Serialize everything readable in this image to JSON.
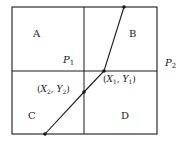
{
  "diagram": {
    "regions": [
      {
        "id": "A",
        "label": "A"
      },
      {
        "id": "B",
        "label": "B"
      },
      {
        "id": "C",
        "label": "C"
      },
      {
        "id": "D",
        "label": "D"
      }
    ],
    "planes": {
      "p1": {
        "base": "P",
        "sub": "1"
      },
      "p2": {
        "base": "P",
        "sub": "2"
      }
    },
    "points": {
      "pt1": {
        "open": "(",
        "x": "X",
        "xsub": "1",
        "sep": ", ",
        "y": "Y",
        "ysub": "1",
        "close": ")"
      },
      "pt2": {
        "open": "(",
        "x": "X",
        "xsub": "2",
        "sep": ", ",
        "y": "Y",
        "ysub": "2",
        "close": ")"
      }
    },
    "colors": {
      "line": "#1a1a1a",
      "background": "#ffffff"
    }
  }
}
